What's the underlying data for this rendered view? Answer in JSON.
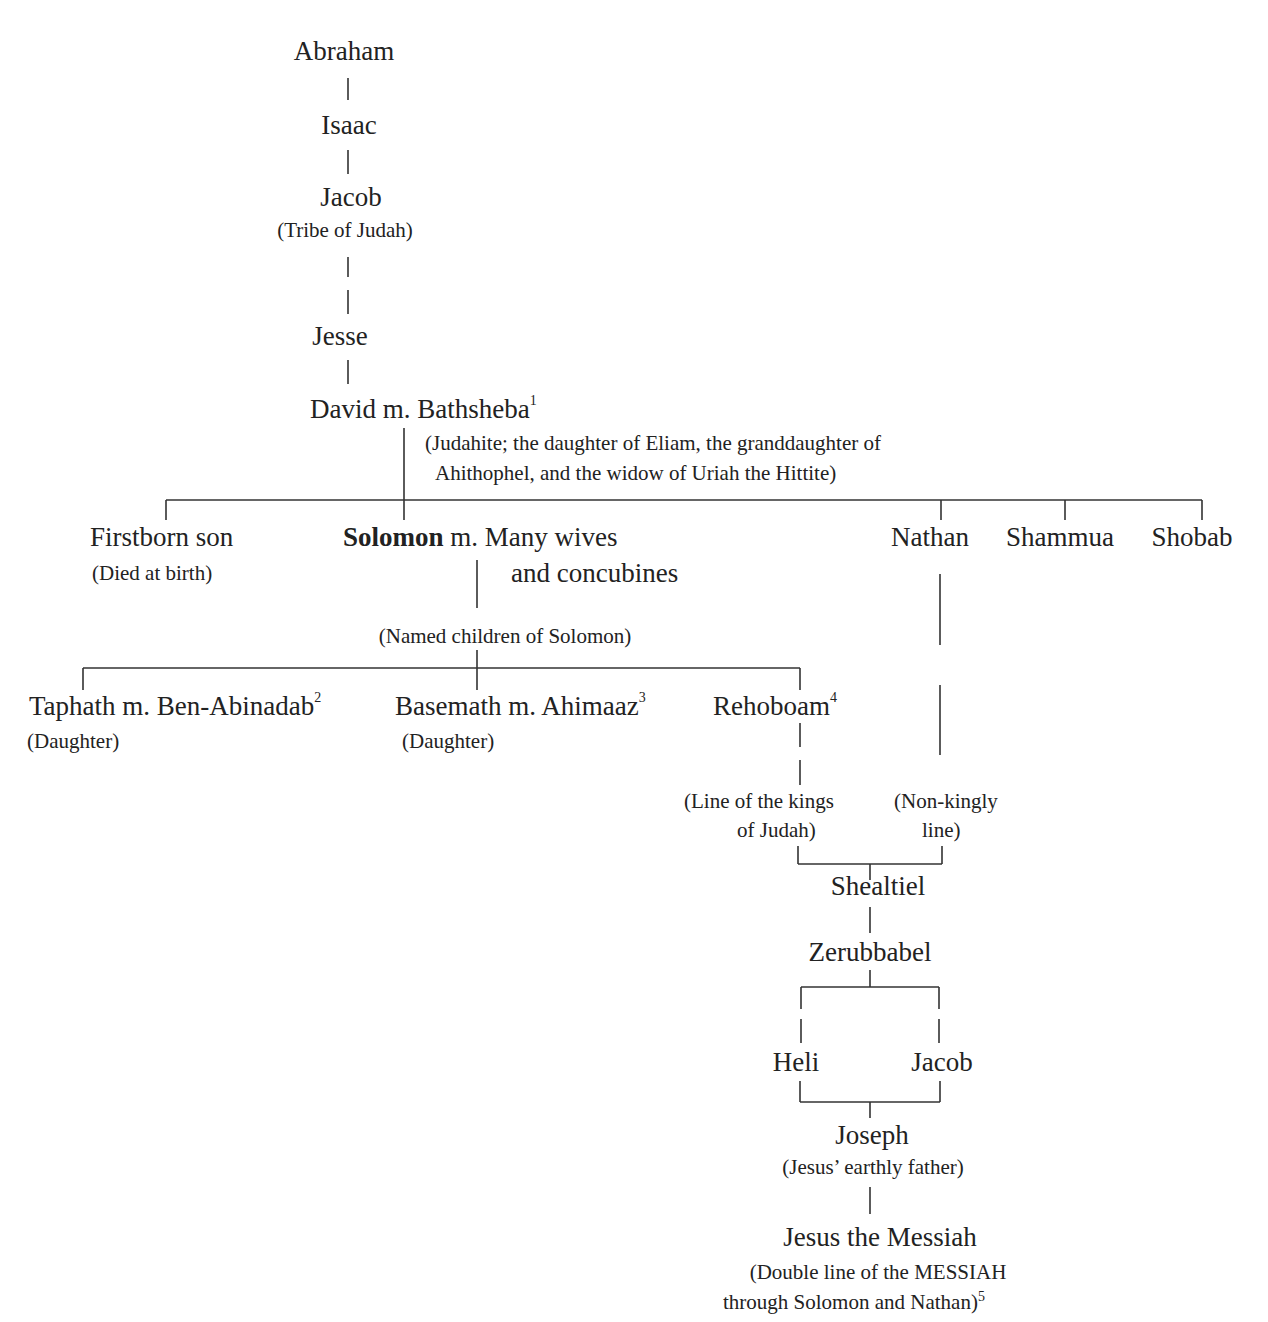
{
  "diagram": {
    "type": "genealogy-tree",
    "line_color": "#333333",
    "text_color": "#222222"
  },
  "nodes": {
    "abraham": {
      "name": "Abraham"
    },
    "isaac": {
      "name": "Isaac"
    },
    "jacob_patriarch": {
      "name": "Jacob",
      "note": "(Tribe of Judah)"
    },
    "jesse": {
      "name": "Jesse"
    },
    "david": {
      "name": "David m. Bathsheba",
      "sup": "1",
      "note_line1": "(Judahite; the daughter of Eliam, the granddaughter of",
      "note_line2": "Ahithophel, and the widow of Uriah the Hittite)"
    },
    "firstborn": {
      "name": "Firstborn son",
      "note": "(Died at birth)"
    },
    "solomon": {
      "name_bold": "Solomon",
      "name_rest": " m. Many wives",
      "name_line2": "and concubines"
    },
    "solomon_children_label": {
      "text": "(Named children of Solomon)"
    },
    "nathan": {
      "name": "Nathan"
    },
    "shammua": {
      "name": "Shammua"
    },
    "shobab": {
      "name": "Shobab"
    },
    "taphath": {
      "name": "Taphath m. Ben-Abinadab",
      "sup": "2",
      "note": "(Daughter)"
    },
    "basemath": {
      "name": "Basemath m. Ahimaaz",
      "sup": "3",
      "note": "(Daughter)"
    },
    "rehoboam": {
      "name": "Rehoboam",
      "sup": "4"
    },
    "kings_line": {
      "line1": "(Line of the kings",
      "line2": "of Judah)"
    },
    "nonkingly_line": {
      "line1": "(Non-kingly",
      "line2": "line)"
    },
    "shealtiel": {
      "name": "Shealtiel"
    },
    "zerubbabel": {
      "name": "Zerubbabel"
    },
    "heli": {
      "name": "Heli"
    },
    "jacob_father_of_joseph": {
      "name": "Jacob"
    },
    "joseph": {
      "name": "Joseph",
      "note": "(Jesus’ earthly father)"
    },
    "jesus": {
      "name": "Jesus the Messiah",
      "note_line1": "(Double line of the MESSIAH",
      "note_line2": "through Solomon and Nathan)",
      "sup": "5"
    }
  }
}
